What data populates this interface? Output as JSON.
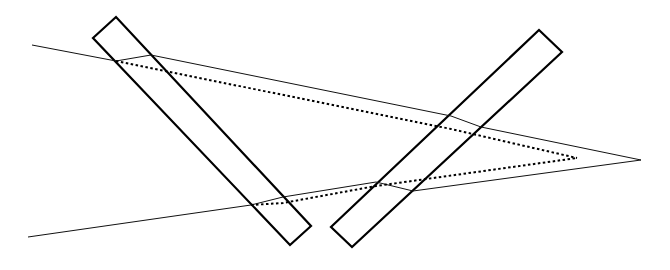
{
  "diagram": {
    "title": "",
    "elements": [
      {
        "id": "left-slab",
        "kind": "rectangle-slab"
      },
      {
        "id": "right-slab",
        "kind": "rectangle-slab"
      },
      {
        "id": "upper-ray",
        "kind": "solid-ray"
      },
      {
        "id": "lower-ray",
        "kind": "solid-ray"
      },
      {
        "id": "apparent-path",
        "kind": "dotted-ray-triangle"
      }
    ],
    "colors": {
      "stroke": "#000000",
      "background": "#ffffff"
    }
  }
}
